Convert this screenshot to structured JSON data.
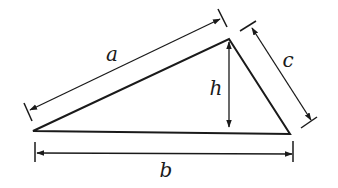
{
  "diagram": {
    "colors": {
      "stroke": "#1a1a1a",
      "background": "#ffffff"
    },
    "vertices": {
      "left": [
        33,
        131
      ],
      "apex": [
        229,
        39
      ],
      "right": [
        290,
        134
      ]
    },
    "labels": {
      "a": "a",
      "b": "b",
      "c": "c",
      "h": "h"
    },
    "label_positions": {
      "a": [
        112,
        55
      ],
      "b": [
        165,
        172
      ],
      "c": [
        287,
        62
      ],
      "h": [
        216,
        90
      ]
    },
    "dimensions": {
      "a": {
        "from": [
          28,
          110
        ],
        "to": [
          222,
          18
        ]
      },
      "b": {
        "from": [
          36,
          153
        ],
        "to": [
          293,
          153
        ]
      },
      "c": {
        "from": [
          252,
          28
        ],
        "to": [
          311,
          121
        ]
      },
      "h": {
        "from": [
          229,
          42
        ],
        "to": [
          229,
          128
        ]
      }
    }
  }
}
